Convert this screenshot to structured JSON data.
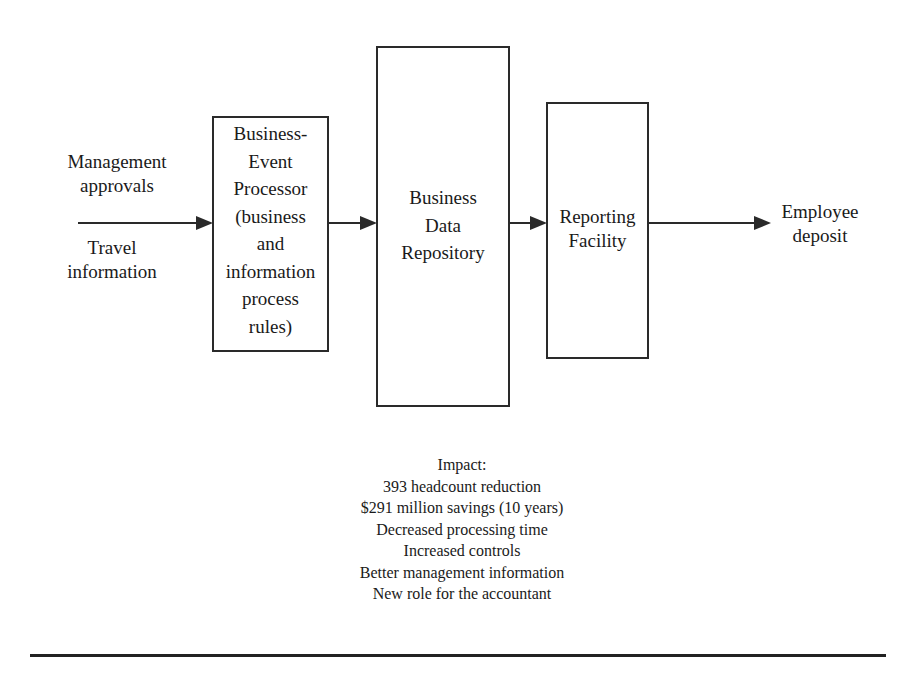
{
  "inputs": {
    "top_label": "Management\napprovals",
    "bottom_label": "Travel\ninformation"
  },
  "boxes": [
    {
      "id": "business-event-processor",
      "label": "Business-\nEvent\nProcessor\n(business\nand\ninformation\nprocess\nrules)"
    },
    {
      "id": "business-data-repository",
      "label": "Business\nData\nRepository"
    },
    {
      "id": "reporting-facility",
      "label": "Reporting\nFacility"
    }
  ],
  "output": {
    "label": "Employee\ndeposit"
  },
  "impact": {
    "title": "Impact:",
    "items": [
      "393 headcount reduction",
      "$291 million savings (10 years)",
      "Decreased processing time",
      "Increased controls",
      "Better management information",
      "New role for the accountant"
    ]
  },
  "colors": {
    "line": "#2a2a2a",
    "background": "#ffffff"
  }
}
